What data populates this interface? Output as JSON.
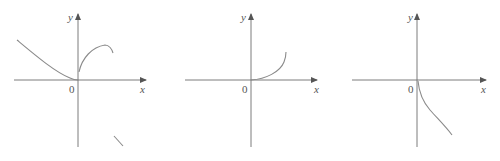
{
  "figure": {
    "panels": [
      {
        "id": "graph-1",
        "axis_labels": {
          "x": "x",
          "y": "y",
          "origin": "0"
        },
        "curves": [
          "decreasing curve from upper-left flattening into the origin",
          "concave-down arc rising from just above origin then turning down",
          "short isolated descending segment in lower-right quadrant"
        ]
      },
      {
        "id": "graph-2",
        "axis_labels": {
          "x": "x",
          "y": "y",
          "origin": "0"
        },
        "curves": [
          "increasing concave-up curve starting at origin in first quadrant"
        ]
      },
      {
        "id": "graph-3",
        "axis_labels": {
          "x": "x",
          "y": "y",
          "origin": "0"
        },
        "curves": [
          "decreasing curve starting at origin going down-right in fourth quadrant"
        ]
      }
    ]
  }
}
